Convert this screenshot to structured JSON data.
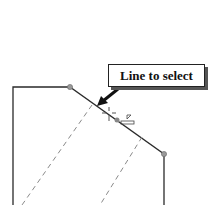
{
  "callout": {
    "label": "Line to select"
  },
  "colors": {
    "solid_line": "#2a2a2a",
    "dashed_line": "#8a8a8a",
    "endpoint": "#999999",
    "background": "#ffffff"
  },
  "sketch": {
    "icons": [
      "arrow-pointer-icon",
      "crosshair-cursor-icon",
      "line-select-cursor-icon",
      "endpoint-dot-icon"
    ]
  }
}
